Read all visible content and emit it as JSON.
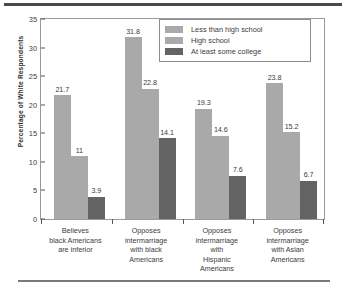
{
  "chart_data": {
    "type": "bar",
    "title": "",
    "xlabel": "",
    "ylabel": "Percentage of White Respondents",
    "ylim": [
      0,
      35
    ],
    "yticks": [
      0,
      5,
      10,
      15,
      20,
      25,
      30,
      35
    ],
    "grid": false,
    "legend_position": "top-right",
    "categories": [
      "Believes\nblack Americans\nare inferior",
      "Opposes\nintermarriage\nwith black\nAmericans",
      "Opposes\nintermarriage\nwith\nHispanic\nAmericans",
      "Opposes\nintermarriage\nwith Asian\nAmericans"
    ],
    "category_lines": [
      [
        "Believes",
        "black Americans",
        "are inferior"
      ],
      [
        "Opposes",
        "intermarriage",
        "with black",
        "Americans"
      ],
      [
        "Opposes",
        "intermarriage",
        "with",
        "Hispanic",
        "Americans"
      ],
      [
        "Opposes",
        "intermarriage",
        "with Asian",
        "Americans"
      ]
    ],
    "series": [
      {
        "name": "Less than high school",
        "color": "#a9a9a9",
        "values": [
          21.7,
          31.8,
          19.3,
          23.8
        ],
        "labels": [
          "21.7",
          "31.8",
          "19.3",
          "23.8"
        ]
      },
      {
        "name": "High school",
        "color": "#a9a9a9",
        "values": [
          11,
          22.8,
          14.6,
          15.2
        ],
        "labels": [
          "11",
          "22.8",
          "14.6",
          "15.2"
        ]
      },
      {
        "name": "At least some college",
        "color": "#636363",
        "values": [
          3.9,
          14.1,
          7.6,
          6.7
        ],
        "labels": [
          "3.9",
          "14.1",
          "7.6",
          "6.7"
        ]
      }
    ]
  },
  "axis": {
    "ytick_labels": [
      "35",
      "30",
      "25",
      "20",
      "15",
      "10",
      "5",
      "0"
    ],
    "ylabel": "Percentage of White Respondents"
  },
  "legend": {
    "items": [
      {
        "label": "Less than high school",
        "color": "#a9a9a9"
      },
      {
        "label": "High school",
        "color": "#a9a9a9"
      },
      {
        "label": "At least some college",
        "color": "#636363"
      }
    ]
  }
}
